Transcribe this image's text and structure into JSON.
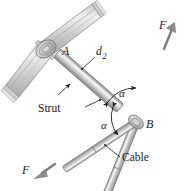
{
  "figure": {
    "kind": "engineering-mechanics-free-body-diagram",
    "width": 192,
    "height": 191,
    "background_color": "#ffffff"
  },
  "colors": {
    "ink": "#1a1a1a",
    "member_fill_light": "#e2e2e2",
    "member_fill_mid": "#b9b9b9",
    "member_fill_dark": "#8f8f8f",
    "member_stroke": "#6f6f6f",
    "bracket_fill": "#d7d7d7",
    "bracket_stroke": "#808080",
    "highlight": "#f4f4f4",
    "arrow_fill": "#9a9a9a"
  },
  "labels": {
    "point_a": "A",
    "point_b": "B",
    "dimension_d2_base": "d",
    "dimension_d2_sub": "2",
    "strut": "Strut",
    "cable": "Cable",
    "angle_upper": "α",
    "angle_lower": "α",
    "force_upper": "F",
    "force_lower": "F"
  },
  "elements": {
    "wall_bracket": "bent-channel-wall-bracket",
    "pin_joint_a": "pin-joint-collar",
    "strut_member": "strut-rod-from-A-to-B",
    "upper_cable": "cable-from-B-up-right",
    "lower_cable": "cable-from-B-down-left",
    "joint_b": "pin-joint-B",
    "force_arrow_upper": "force-arrow-up-right",
    "force_arrow_lower": "force-arrow-down-left",
    "angle_arc_upper": "angle-arc-between-strut-and-upper-cable",
    "angle_arc_lower": "angle-arc-between-strut-and-lower-cable",
    "leader_d2": "leader-line-to-strut-dimension",
    "leader_strut": "leader-line-to-strut",
    "leader_cable": "leader-line-to-cable"
  },
  "geometry": {
    "point_a": [
      57,
      53
    ],
    "point_b": [
      136,
      122
    ],
    "upper_cable_tip": [
      174,
      25
    ],
    "lower_cable_tip": [
      35,
      177
    ],
    "bracket_bend": [
      46,
      48
    ],
    "bracket_top_end": [
      98,
      10
    ],
    "bracket_bottom_end": [
      10,
      92
    ]
  }
}
